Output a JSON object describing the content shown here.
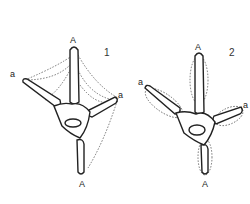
{
  "figure": {
    "panels": [
      {
        "number": "1",
        "labels": {
          "top": "A",
          "left": "a",
          "right": "a",
          "bottom": "A"
        }
      },
      {
        "number": "2",
        "labels": {
          "top": "A",
          "left": "a",
          "right": "a",
          "bottom": "A"
        }
      }
    ],
    "colors": {
      "line": "#222222",
      "background": "#ffffff"
    }
  }
}
